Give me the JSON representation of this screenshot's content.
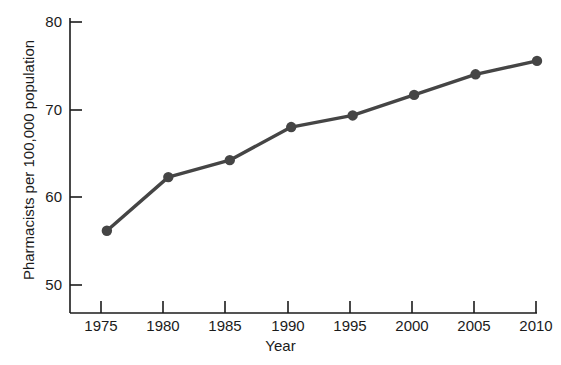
{
  "chart_data": {
    "type": "line",
    "title": "",
    "subtitle": "",
    "xlabel": "Year",
    "ylabel": "Pharmacists per 100,000 population",
    "x": [
      1975,
      1980,
      1985,
      1990,
      1995,
      2000,
      2005,
      2010
    ],
    "categories": [
      "1975",
      "1980",
      "1985",
      "1990",
      "1995",
      "2000",
      "2005",
      "2010"
    ],
    "series": [
      {
        "name": "Pharmacists per 100,000 population",
        "values": [
          56.2,
          62.2,
          64.1,
          67.8,
          69.1,
          71.4,
          73.7,
          75.2
        ]
      }
    ],
    "values": [
      56.2,
      62.2,
      64.1,
      67.8,
      69.1,
      71.4,
      73.7,
      75.2
    ],
    "xlim": [
      1972,
      2010
    ],
    "ylim": [
      47,
      80
    ],
    "xticks": [
      1975,
      1980,
      1985,
      1990,
      1995,
      2000,
      2005,
      2010
    ],
    "xtick_labels": [
      "1975",
      "1980",
      "1985",
      "1990",
      "1995",
      "2000",
      "2005",
      "2010"
    ],
    "yticks": [
      50,
      60,
      70,
      80
    ],
    "ytick_labels": [
      "50",
      "60",
      "70",
      "80"
    ],
    "grid": false,
    "legend": false,
    "legend_position": "none",
    "line_color": "#454545",
    "marker_color": "#454545",
    "marker": "circle",
    "axis_color": "#1b1b1b",
    "background_color": "#ffffff"
  }
}
